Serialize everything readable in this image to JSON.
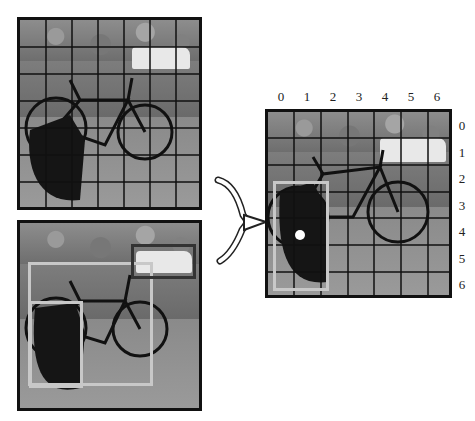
{
  "diagram": {
    "grid_size": 7,
    "panels": {
      "top_left": {
        "description": "input image divided into 7x7 grid"
      },
      "bottom_left": {
        "description": "bounding box predictions",
        "boxes": [
          "bicycle",
          "dog",
          "car"
        ]
      },
      "right": {
        "description": "dog detection with responsible cell highlighted"
      }
    },
    "column_labels": [
      "0",
      "1",
      "2",
      "3",
      "4",
      "5",
      "6"
    ],
    "row_labels": [
      "0",
      "1",
      "2",
      "3",
      "4",
      "5",
      "6"
    ],
    "arrow": "merge-arrow",
    "colors": {
      "frame": "#111111",
      "box_light": "#c8c8c8",
      "box_dark": "#333333",
      "center_dot": "#ffffff"
    }
  }
}
